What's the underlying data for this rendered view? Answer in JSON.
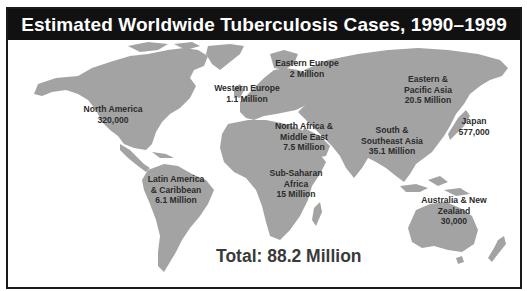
{
  "title": "Estimated Worldwide Tuberculosis Cases, 1990–1999",
  "colors": {
    "title_background": "#111111",
    "title_text": "#ffffff",
    "land": "#a3a3a3",
    "ocean": "#ffffff",
    "label_text": "#2b2b2b"
  },
  "regions": [
    {
      "id": "north-america",
      "name": "North America",
      "lines": [
        "North America",
        "320,000"
      ],
      "value": "320,000",
      "cases": 320000
    },
    {
      "id": "latin-america",
      "name": "Latin America & Caribbean",
      "lines": [
        "Latin America",
        "& Caribbean",
        "6.1 Million"
      ],
      "value": "6.1 Million",
      "cases": 6100000
    },
    {
      "id": "western-europe",
      "name": "Western Europe",
      "lines": [
        "Western Europe",
        "1.1 Million"
      ],
      "value": "1.1 Million",
      "cases": 1100000
    },
    {
      "id": "eastern-europe",
      "name": "Eastern Europe",
      "lines": [
        "Eastern Europe",
        "2 Million"
      ],
      "value": "2 Million",
      "cases": 2000000
    },
    {
      "id": "north-africa-middle-east",
      "name": "North Africa & Middle East",
      "lines": [
        "North Africa &",
        "Middle East",
        "7.5 Million"
      ],
      "value": "7.5 Million",
      "cases": 7500000
    },
    {
      "id": "sub-saharan-africa",
      "name": "Sub-Saharan Africa",
      "lines": [
        "Sub-Saharan",
        "Africa",
        "15 Million"
      ],
      "value": "15 Million",
      "cases": 15000000
    },
    {
      "id": "eastern-pacific-asia",
      "name": "Eastern & Pacific Asia",
      "lines": [
        "Eastern &",
        "Pacific Asia",
        "20.5 Million"
      ],
      "value": "20.5 Million",
      "cases": 20500000
    },
    {
      "id": "south-southeast-asia",
      "name": "South & Southeast Asia",
      "lines": [
        "South &",
        "Southeast Asia",
        "35.1 Million"
      ],
      "value": "35.1 Million",
      "cases": 35100000
    },
    {
      "id": "japan",
      "name": "Japan",
      "lines": [
        "Japan",
        "577,000"
      ],
      "value": "577,000",
      "cases": 577000
    },
    {
      "id": "australia-new-zealand",
      "name": "Australia & New Zealand",
      "lines": [
        "Australia &  New",
        "Zealand",
        "30,000"
      ],
      "value": "30,000",
      "cases": 30000
    }
  ],
  "total": {
    "label": "Total: 88.2 Million",
    "value": "88.2 Million",
    "cases": 88200000
  }
}
